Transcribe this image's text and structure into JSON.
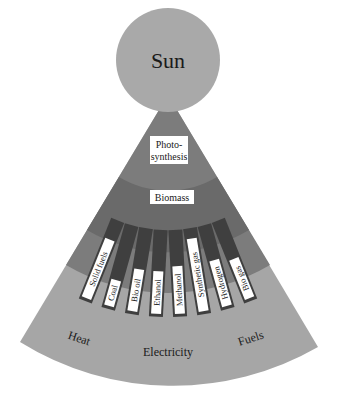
{
  "diagram": {
    "sun": {
      "label": "Sun"
    },
    "stages": [
      {
        "label_line1": "Photo-",
        "label_line2": "synthesis"
      },
      {
        "label": "Biomass"
      }
    ],
    "products": [
      "Solid fuels",
      "Coal",
      "Bio oil",
      "Ethanol",
      "Methanol",
      "Synthetic gas",
      "Hydrogen",
      "Bio gas"
    ],
    "uses": [
      "Heat",
      "Electricity",
      "Fuels"
    ],
    "colors": {
      "sun": "#a9a9a9",
      "outer_fan": "#a6a6a6",
      "photosynthesis_band": "#7c7c7c",
      "biomass_band": "#6a6a6a",
      "strip": "#3f3f3f",
      "label_box": "#ffffff"
    }
  }
}
